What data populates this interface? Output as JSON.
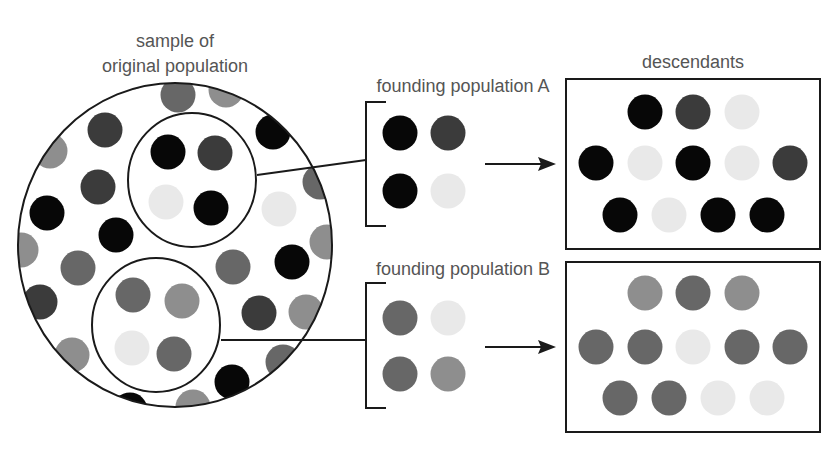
{
  "figure": {
    "sample_label_line1": "sample of",
    "sample_label_line2": "original population",
    "founding_a_label": "founding population A",
    "founding_b_label": "founding population B",
    "descendants_label": "descendants"
  },
  "palette": {
    "black": "#070707",
    "dark": "#3b3b3b",
    "darkgray": "#676767",
    "midgray": "#8e8e8e",
    "light": "#e9e9e9",
    "text": "#555555",
    "outline": "#1a1a1a"
  },
  "original_population": {
    "dots": [
      "midgray",
      "darkgray",
      "midgray",
      "dark",
      "black",
      "midgray",
      "dark",
      "darkgray",
      "light",
      "black",
      "black",
      "midgray",
      "midgray",
      "darkgray",
      "darkgray",
      "black",
      "dark",
      "dark",
      "midgray",
      "midgray",
      "darkgray",
      "black",
      "midgray",
      "black"
    ]
  },
  "sample_a": {
    "dots": [
      "black",
      "dark",
      "light",
      "black"
    ]
  },
  "sample_b": {
    "dots": [
      "darkgray",
      "midgray",
      "light",
      "darkgray"
    ]
  },
  "founding_a": {
    "dots": [
      "black",
      "dark",
      "black",
      "light"
    ]
  },
  "founding_b": {
    "dots": [
      "darkgray",
      "light",
      "darkgray",
      "midgray"
    ]
  },
  "descendants_a": {
    "rows": [
      [
        "black",
        "dark",
        "light"
      ],
      [
        "black",
        "light",
        "black",
        "light",
        "dark"
      ],
      [
        "black",
        "light",
        "black",
        "black"
      ]
    ]
  },
  "descendants_b": {
    "rows": [
      [
        "midgray",
        "darkgray",
        "midgray"
      ],
      [
        "darkgray",
        "darkgray",
        "light",
        "darkgray",
        "darkgray"
      ],
      [
        "darkgray",
        "darkgray",
        "light",
        "light"
      ]
    ]
  }
}
